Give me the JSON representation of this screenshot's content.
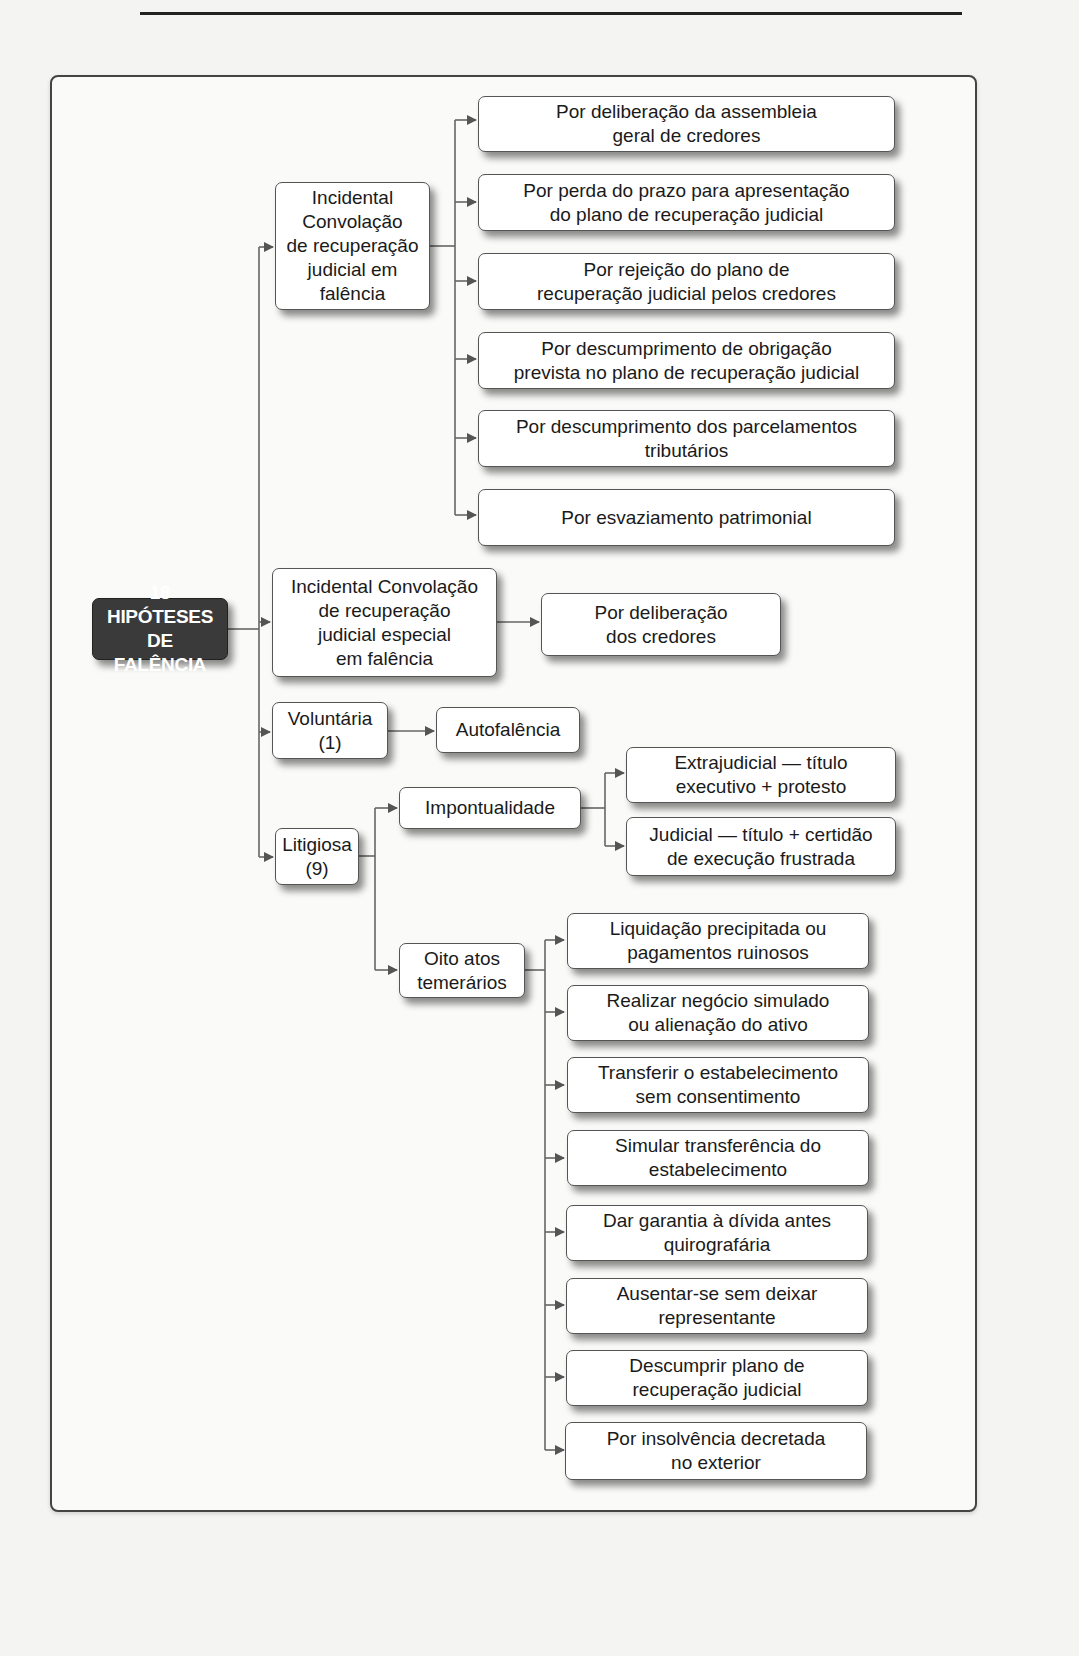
{
  "diagram": {
    "root": {
      "label": "18 HIPÓTESES\nDE FALÊNCIA"
    },
    "branches": [
      {
        "label": "Incidental\nConvolação\nde recuperação\njudicial em\nfalência",
        "children": [
          "Por deliberação da assembleia\ngeral de credores",
          "Por perda do prazo para apresentação\ndo plano de recuperação judicial",
          "Por rejeição do plano de\nrecuperação judicial pelos credores",
          "Por descumprimento de obrigação\nprevista no plano de recuperação judicial",
          "Por descumprimento dos parcelamentos\ntributários",
          "Por esvaziamento patrimonial"
        ]
      },
      {
        "label": "Incidental Convolação\nde recuperação\njudicial especial\nem falência",
        "children": [
          "Por deliberação\ndos credores"
        ]
      },
      {
        "label": "Voluntária\n(1)",
        "children": [
          "Autofalência"
        ]
      },
      {
        "label": "Litigiosa\n(9)",
        "children": [
          {
            "label": "Impontualidade",
            "children": [
              "Extrajudicial — título\nexecutivo + protesto",
              "Judicial — título + certidão\nde execução frustrada"
            ]
          },
          {
            "label": "Oito atos\ntemerários",
            "children": [
              "Liquidação precipitada ou\npagamentos ruinosos",
              "Realizar negócio simulado\nou alienação do ativo",
              "Transferir o estabelecimento\nsem consentimento",
              "Simular transferência do\nestabelecimento",
              "Dar garantia à dívida antes\nquirografária",
              "Ausentar-se sem deixar\nrepresentante",
              "Descumprir plano de\nrecuperação judicial",
              "Por insolvência decretada\nno exterior"
            ]
          }
        ]
      }
    ],
    "colors": {
      "root_fill": "#3a3a3a",
      "root_text": "#ffffff",
      "box_fill": "#ffffff",
      "line": "#555555"
    }
  }
}
